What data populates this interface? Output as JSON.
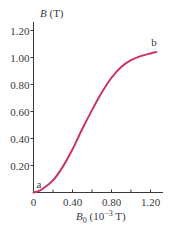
{
  "chart_data": {
    "type": "line",
    "title": "",
    "xlabel": "B0 (10^-3 T)",
    "ylabel": "B (T)",
    "xlabel_parts": {
      "symbol": "B",
      "sub": "0",
      "unit_pre": " (10",
      "exp": "−3",
      "unit_post": " T)"
    },
    "ylabel_parts": {
      "symbol": "B",
      "unit": " (T)"
    },
    "xlim": [
      0,
      1.3
    ],
    "ylim": [
      0,
      1.3
    ],
    "x_major_ticks": [
      0,
      0.4,
      0.8,
      1.2
    ],
    "x_tick_labels": [
      "0",
      "0.40",
      "0.80",
      "1.20"
    ],
    "x_minor_ticks": [
      0.2,
      0.6,
      1.0
    ],
    "y_ticks": [
      0.2,
      0.4,
      0.6,
      0.8,
      1.0,
      1.2
    ],
    "y_tick_labels": [
      "0.20",
      "0.40",
      "0.60",
      "0.80",
      "1.00",
      "1.20"
    ],
    "grid": false,
    "legend": null,
    "series": [
      {
        "name": "magnetization curve a→b",
        "color": "#c8336a",
        "x": [
          0.0,
          0.05,
          0.1,
          0.2,
          0.3,
          0.4,
          0.5,
          0.6,
          0.7,
          0.8,
          0.9,
          1.0,
          1.1,
          1.2,
          1.26
        ],
        "y": [
          0.0,
          0.01,
          0.03,
          0.09,
          0.19,
          0.32,
          0.47,
          0.61,
          0.74,
          0.85,
          0.93,
          0.98,
          1.01,
          1.03,
          1.04
        ]
      }
    ],
    "annotations": [
      {
        "text": "a",
        "x": 0.0,
        "y": 0.0
      },
      {
        "text": "b",
        "x": 1.26,
        "y": 1.04
      }
    ]
  }
}
